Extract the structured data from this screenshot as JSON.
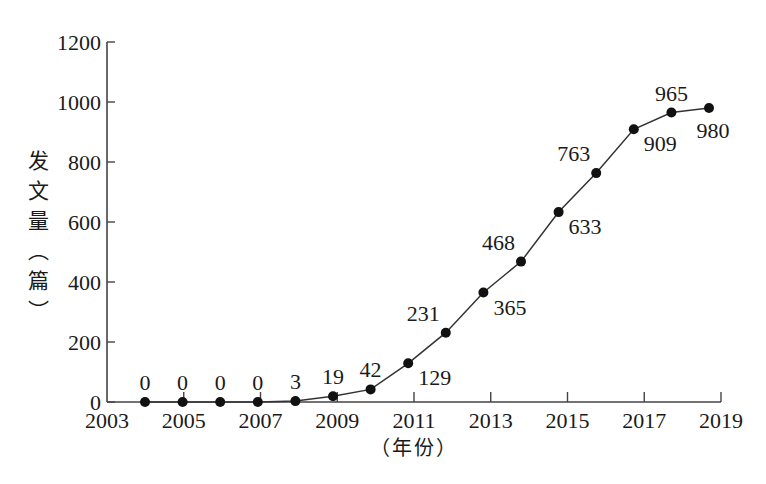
{
  "chart_data": {
    "type": "line",
    "title": "",
    "xlabel": "（年份）",
    "ylabel": "发文量（篇）",
    "x": [
      2004,
      2005,
      2006,
      2007,
      2008,
      2009,
      2010,
      2011,
      2012,
      2013,
      2014,
      2015,
      2016,
      2017,
      2018,
      2019
    ],
    "series": [
      {
        "name": "发文量",
        "values": [
          0,
          0,
          0,
          0,
          3,
          19,
          42,
          129,
          231,
          365,
          468,
          633,
          763,
          909,
          965,
          980
        ]
      }
    ],
    "data_labels": [
      "0",
      "0",
      "0",
      "0",
      "3",
      "19",
      "42",
      "129",
      "231",
      "365",
      "468",
      "633",
      "763",
      "909",
      "965",
      "980"
    ],
    "label_positions": [
      "above",
      "above",
      "above",
      "above",
      "above",
      "above",
      "above",
      "below-right",
      "above-left",
      "below-right",
      "above-left",
      "below-right",
      "above-left",
      "below-right",
      "above",
      "below"
    ],
    "x_ticks": [
      "2003",
      "2005",
      "2007",
      "2009",
      "2011",
      "2013",
      "2015",
      "2017",
      "2019"
    ],
    "y_ticks": [
      "0",
      "200",
      "400",
      "600",
      "800",
      "1000",
      "1200"
    ],
    "xlim": [
      2003,
      2019
    ],
    "ylim": [
      0,
      1200
    ],
    "grid": false,
    "legend": "none",
    "marker": "filled-circle",
    "line_color": "#333333",
    "marker_color": "#111111"
  },
  "axis": {
    "ylabel_chars": [
      "发",
      "文",
      "量",
      "︵",
      "篇",
      "︶"
    ],
    "xlabel": "（年份）"
  }
}
